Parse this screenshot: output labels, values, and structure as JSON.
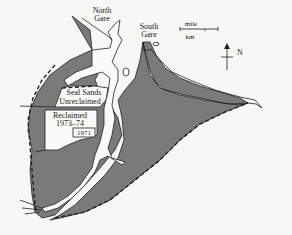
{
  "map": {
    "labels": {
      "north_gare_line1": "North",
      "north_gare_line2": "Gare",
      "south_gare_line1": "South",
      "south_gare_line2": "Gare",
      "seal_sands": "Seal Sands",
      "unreclaimed": "Unreclaimed",
      "reclaimed_line1": "Reclaimed",
      "reclaimed_line2": "1973–74",
      "reclaimed_1971": "1971"
    },
    "scale_bar": {
      "top_label": "mile",
      "bottom_label": "km"
    },
    "north_arrow": {
      "label": "N"
    },
    "legend": {
      "shaded_fill": "#7a7a78",
      "water_fill": "#fbfbf9"
    }
  }
}
